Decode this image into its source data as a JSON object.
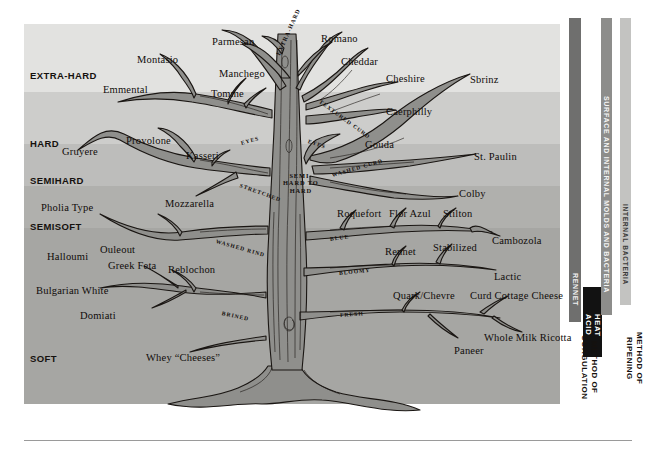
{
  "figure": {
    "palette": {
      "extra_hard": "#e2e2e0",
      "hard": "#cdcdcb",
      "semihard": "#bdbdbb",
      "semisoft": "#b0b0ad",
      "soft": "#a6a6a3",
      "trunk_fill": "#8f8f8c",
      "trunk_stroke": "#1a1613",
      "bar_rennet": "#6f6f6e",
      "bar_heat_acid": "#121212",
      "bar_surface": "#8d8d8b",
      "bar_internal": "#c3c3c1",
      "text": "#15110e",
      "rule": "#9a9a9a"
    }
  },
  "hardness_bands": [
    {
      "label": "EXTRA-HARD",
      "top": 24,
      "height": 68,
      "label_y": 70,
      "color": "#e2e2e0"
    },
    {
      "label": "HARD",
      "top": 92,
      "height": 52,
      "label_y": 138,
      "color": "#cdcdcb"
    },
    {
      "label": "SEMIHARD",
      "top": 144,
      "height": 42,
      "label_y": 175,
      "color": "#bdbdbb"
    },
    {
      "label": "SEMISOFT",
      "top": 186,
      "height": 42,
      "label_y": 221,
      "color": "#b0b0ad"
    },
    {
      "label": "SOFT",
      "top": 228,
      "height": 176,
      "label_y": 353,
      "color": "#a6a6a3"
    }
  ],
  "axis_bars": [
    {
      "name": "rennet",
      "label": "RENNET",
      "x": 569,
      "y": 18,
      "w": 12,
      "h": 304,
      "bg": "#6f6f6e",
      "fg": "#f2f2f2",
      "font_size": 7,
      "text_top": 255
    },
    {
      "name": "heat-acid",
      "label": "HEAT\nACID",
      "x": 583,
      "y": 287,
      "w": 19,
      "h": 70,
      "bg": "#121212",
      "fg": "#ffffff",
      "font_size": 7.6,
      "text_top": 0
    },
    {
      "name": "surface-and-internal-molds-and-bacteria",
      "label": "SURFACE AND INTERNAL MOLDS AND BACTERIA",
      "x": 601,
      "y": 18,
      "w": 11,
      "h": 297,
      "bg": "#8d8d8b",
      "fg": "#f4f4f4",
      "font_size": 7,
      "text_top": 78
    },
    {
      "name": "internal-bacteria",
      "label": "INTERNAL BACTERIA",
      "x": 620,
      "y": 18,
      "w": 11,
      "h": 287,
      "bg": "#c3c3c1",
      "fg": "#3a3a38",
      "font_size": 6.6,
      "text_top": 186
    }
  ],
  "axis_titles": [
    {
      "name": "method-of-coagulation",
      "label": "METHOD OF COAGULATION",
      "x": 579,
      "y": 330,
      "width": 74
    },
    {
      "name": "method-of-ripening",
      "label": "METHOD OF RIPENING",
      "x": 624,
      "y": 318,
      "width": 80
    }
  ],
  "trunk_labels": [
    {
      "text": "EXTRA-HARD",
      "x": 278,
      "y": 52,
      "rot": -66,
      "size": 6.0
    },
    {
      "text": "TEXTURED CURD",
      "x": 320,
      "y": 98,
      "rot": 36,
      "size": 5.6
    },
    {
      "text": "EYES",
      "x": 241,
      "y": 140,
      "rot": -16,
      "size": 5.6
    },
    {
      "text": "EYES",
      "x": 308,
      "y": 138,
      "rot": 18,
      "size": 5.6
    },
    {
      "text": "SEMI-\nHARD TO\nHARD",
      "x": 283,
      "y": 172,
      "rot": 0,
      "size": 6.4,
      "block": true
    },
    {
      "text": "STRETCHED",
      "x": 240,
      "y": 182,
      "rot": 20,
      "size": 5.6
    },
    {
      "text": "WASHED CURD",
      "x": 332,
      "y": 172,
      "rot": -16,
      "size": 5.6
    },
    {
      "text": "WASHED RIND",
      "x": 216,
      "y": 238,
      "rot": 16,
      "size": 5.6
    },
    {
      "text": "BLUE",
      "x": 330,
      "y": 236,
      "rot": -8,
      "size": 5.6
    },
    {
      "text": "BRINED",
      "x": 222,
      "y": 310,
      "rot": 12,
      "size": 5.6
    },
    {
      "text": "BLOOMY",
      "x": 339,
      "y": 270,
      "rot": -6,
      "size": 5.6
    },
    {
      "text": "FRESH",
      "x": 340,
      "y": 312,
      "rot": -4,
      "size": 5.6
    }
  ],
  "cheese_labels": [
    {
      "name": "parmesan",
      "text": "Parmesan",
      "x": 212,
      "y": 36
    },
    {
      "name": "romano",
      "text": "Romano",
      "x": 321,
      "y": 33
    },
    {
      "name": "montasio",
      "text": "Montasio",
      "x": 137,
      "y": 54
    },
    {
      "name": "manchego",
      "text": "Manchego",
      "x": 219,
      "y": 68
    },
    {
      "name": "cheddar",
      "text": "Cheddar",
      "x": 341,
      "y": 56
    },
    {
      "name": "cheshire",
      "text": "Cheshire",
      "x": 386,
      "y": 73
    },
    {
      "name": "sbrinz",
      "text": "Sbrinz",
      "x": 470,
      "y": 74
    },
    {
      "name": "emmental",
      "text": "Emmental",
      "x": 103,
      "y": 84
    },
    {
      "name": "tomme",
      "text": "Tomme",
      "x": 211,
      "y": 88
    },
    {
      "name": "caerphilly",
      "text": "Caerphilly",
      "x": 386,
      "y": 106
    },
    {
      "name": "gouda",
      "text": "Gouda",
      "x": 365,
      "y": 139
    },
    {
      "name": "provolone",
      "text": "Provolone",
      "x": 126,
      "y": 135
    },
    {
      "name": "gruyere",
      "text": "Gruyere",
      "x": 62,
      "y": 146
    },
    {
      "name": "kasseri",
      "text": "Kasseri",
      "x": 186,
      "y": 150
    },
    {
      "name": "st-paulin",
      "text": "St. Paulin",
      "x": 474,
      "y": 151
    },
    {
      "name": "mozzarella",
      "text": "Mozzarella",
      "x": 165,
      "y": 198
    },
    {
      "name": "colby",
      "text": "Colby",
      "x": 459,
      "y": 188
    },
    {
      "name": "pholia-type",
      "text": "Pholia Type",
      "x": 41,
      "y": 202
    },
    {
      "name": "roquefort",
      "text": "Roquefort",
      "x": 337,
      "y": 208
    },
    {
      "name": "flor-azul",
      "text": "Flor Azul",
      "x": 389,
      "y": 208
    },
    {
      "name": "stilton",
      "text": "Stilton",
      "x": 443,
      "y": 208
    },
    {
      "name": "cambozola",
      "text": "Cambozola",
      "x": 492,
      "y": 235
    },
    {
      "name": "rennet",
      "text": "Rennet",
      "x": 385,
      "y": 246
    },
    {
      "name": "stabilized",
      "text": "Stabilized",
      "x": 433,
      "y": 242
    },
    {
      "name": "halloumi",
      "text": "Halloumi",
      "x": 47,
      "y": 251
    },
    {
      "name": "ouleout",
      "text": "Ouleout",
      "x": 100,
      "y": 244
    },
    {
      "name": "greek-feta",
      "text": "Greek Feta",
      "x": 108,
      "y": 260
    },
    {
      "name": "reblochon",
      "text": "Reblochon",
      "x": 168,
      "y": 264
    },
    {
      "name": "lactic",
      "text": "Lactic",
      "x": 494,
      "y": 271
    },
    {
      "name": "bulgarian-white",
      "text": "Bulgarian White",
      "x": 36,
      "y": 285
    },
    {
      "name": "quark-chevre",
      "text": "Quark/Chevre",
      "x": 393,
      "y": 290
    },
    {
      "name": "curd-cottage-cheese",
      "text": "Curd Cottage Cheese",
      "x": 470,
      "y": 290
    },
    {
      "name": "domiati",
      "text": "Domiati",
      "x": 80,
      "y": 310
    },
    {
      "name": "whole-milk-ricotta",
      "text": "Whole Milk Ricotta",
      "x": 484,
      "y": 332
    },
    {
      "name": "paneer",
      "text": "Paneer",
      "x": 454,
      "y": 345
    },
    {
      "name": "whey-cheeses",
      "text": "Whey “Cheeses”",
      "x": 146,
      "y": 352
    }
  ]
}
